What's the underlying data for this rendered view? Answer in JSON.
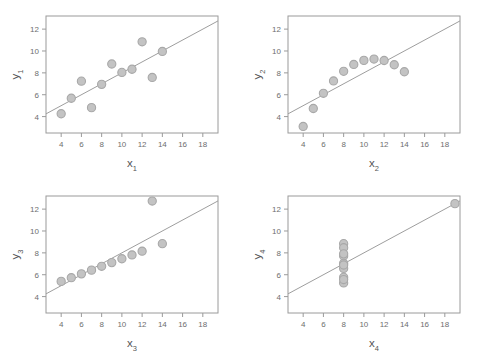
{
  "figure": {
    "title": "",
    "background": "#ffffff",
    "panel_count": 4,
    "marker_color": "#c3c3c3",
    "marker_edge_color": "#a8a8a8",
    "line_color": "#9e9e9e",
    "frame_color": "#9a9a9a",
    "tick_label_color": "#6e6e6e",
    "axis_label_color": "#555555"
  },
  "chart_data": [
    {
      "type": "scatter",
      "title": "",
      "xlabel": "x",
      "xlabel_sub": "1",
      "ylabel": "y",
      "ylabel_sub": "1",
      "xlim": [
        2.5,
        19.5
      ],
      "ylim": [
        2.5,
        13.2
      ],
      "xticks": [
        4,
        6,
        8,
        10,
        12,
        14,
        16,
        18
      ],
      "yticks": [
        4,
        6,
        8,
        10,
        12
      ],
      "grid": false,
      "legend": "none",
      "x": [
        10,
        8,
        13,
        9,
        11,
        14,
        6,
        4,
        12,
        7,
        5
      ],
      "y": [
        8.04,
        6.95,
        7.58,
        8.81,
        8.33,
        9.96,
        7.24,
        4.26,
        10.84,
        4.82,
        5.68
      ],
      "fit": {
        "slope": 0.5,
        "intercept": 3.0,
        "x_start": 2.5,
        "x_end": 19.5
      },
      "annotations": []
    },
    {
      "type": "scatter",
      "title": "",
      "xlabel": "x",
      "xlabel_sub": "2",
      "ylabel": "y",
      "ylabel_sub": "2",
      "xlim": [
        2.5,
        19.5
      ],
      "ylim": [
        2.5,
        13.2
      ],
      "xticks": [
        4,
        6,
        8,
        10,
        12,
        14,
        16,
        18
      ],
      "yticks": [
        4,
        6,
        8,
        10,
        12
      ],
      "grid": false,
      "legend": "none",
      "x": [
        10,
        8,
        13,
        9,
        11,
        14,
        6,
        4,
        12,
        7,
        5
      ],
      "y": [
        9.14,
        8.14,
        8.74,
        8.77,
        9.26,
        8.1,
        6.13,
        3.1,
        9.13,
        7.26,
        4.74
      ],
      "fit": {
        "slope": 0.5,
        "intercept": 3.0,
        "x_start": 2.5,
        "x_end": 19.5
      },
      "annotations": []
    },
    {
      "type": "scatter",
      "title": "",
      "xlabel": "x",
      "xlabel_sub": "3",
      "ylabel": "y",
      "ylabel_sub": "3",
      "xlim": [
        2.5,
        19.5
      ],
      "ylim": [
        2.5,
        13.2
      ],
      "xticks": [
        4,
        6,
        8,
        10,
        12,
        14,
        16,
        18
      ],
      "yticks": [
        4,
        6,
        8,
        10,
        12
      ],
      "grid": false,
      "legend": "none",
      "x": [
        10,
        8,
        13,
        9,
        11,
        14,
        6,
        4,
        12,
        7,
        5
      ],
      "y": [
        7.46,
        6.77,
        12.74,
        7.11,
        7.81,
        8.84,
        6.08,
        5.39,
        8.15,
        6.42,
        5.73
      ],
      "fit": {
        "slope": 0.5,
        "intercept": 3.0,
        "x_start": 2.5,
        "x_end": 19.5
      },
      "annotations": []
    },
    {
      "type": "scatter",
      "title": "",
      "xlabel": "x",
      "xlabel_sub": "4",
      "ylabel": "y",
      "ylabel_sub": "4",
      "xlim": [
        2.5,
        19.5
      ],
      "ylim": [
        2.5,
        13.2
      ],
      "xticks": [
        4,
        6,
        8,
        10,
        12,
        14,
        16,
        18
      ],
      "yticks": [
        4,
        6,
        8,
        10,
        12
      ],
      "grid": false,
      "legend": "none",
      "x": [
        8,
        8,
        8,
        8,
        8,
        8,
        8,
        19,
        8,
        8,
        8
      ],
      "y": [
        6.58,
        5.76,
        7.71,
        8.84,
        8.47,
        7.04,
        5.25,
        12.5,
        5.56,
        7.91,
        6.89
      ],
      "fit": {
        "slope": 0.5,
        "intercept": 3.0,
        "x_start": 2.5,
        "x_end": 19.5
      },
      "annotations": []
    }
  ]
}
